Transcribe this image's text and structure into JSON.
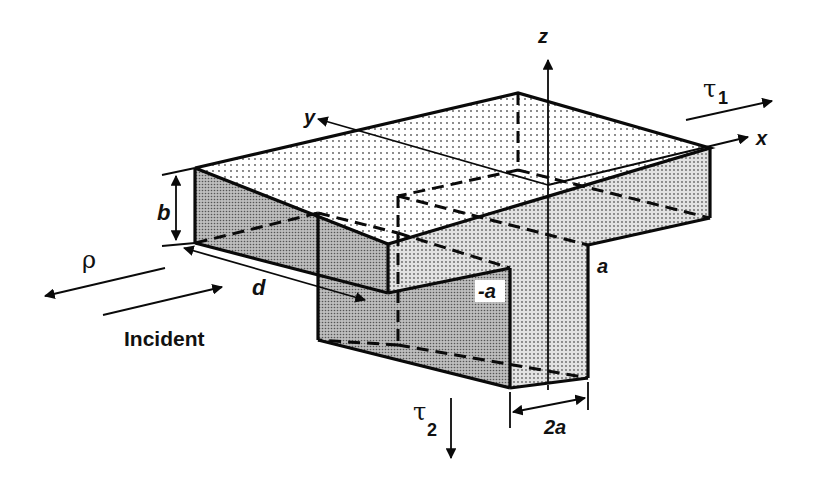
{
  "figure": {
    "colors": {
      "line": "#0a0a0a",
      "top_face_dots": "#bdbdbd",
      "dark_face": "#a9a9a9",
      "light_face": "#d3d3d3",
      "background": "#ffffff"
    }
  },
  "axes": {
    "x_label": "x",
    "y_label": "y",
    "z_label": "z"
  },
  "dimensions": {
    "height_label": "b",
    "length_label": "d",
    "width_label": "2a",
    "upper_edge_label": "a",
    "lower_edge_label": "-a"
  },
  "waves": {
    "reflected_label": "ρ",
    "incident_label": "Incident",
    "transmitted_1_label": "τ",
    "transmitted_1_sub": "1",
    "transmitted_2_label": "τ",
    "transmitted_2_sub": "2"
  }
}
